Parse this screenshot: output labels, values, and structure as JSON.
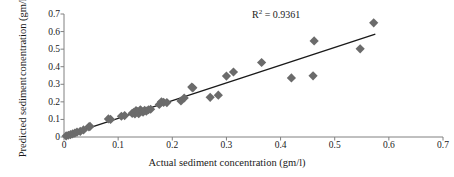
{
  "chart_data": {
    "type": "scatter",
    "title": "",
    "xlabel": "Actual sediment concentration (gm/l)",
    "ylabel_line1": "Predicted sediment",
    "ylabel_line2": "conentration (gm/l)",
    "annotation": "R² = 0.9361",
    "annotation_prefix": "R",
    "annotation_sup": "2",
    "annotation_suffix": " = 0.9361",
    "r_squared": 0.9361,
    "xlim": [
      0,
      0.7
    ],
    "ylim": [
      0,
      0.7
    ],
    "xticks": [
      "0",
      "0.1",
      "0.2",
      "0.3",
      "0.4",
      "0.5",
      "0.6",
      "0.7"
    ],
    "xtick_values": [
      0,
      0.1,
      0.2,
      0.3,
      0.4,
      0.5,
      0.6,
      0.7
    ],
    "yticks": [
      "0",
      "0.1",
      "0.2",
      "0.3",
      "0.4",
      "0.5",
      "0.6",
      "0.7"
    ],
    "ytick_values": [
      0,
      0.1,
      0.2,
      0.3,
      0.4,
      0.5,
      0.6,
      0.7
    ],
    "grid": false,
    "legend": "none",
    "marker": "diamond",
    "marker_color": "#6b6b6b",
    "marker_size": 4.6,
    "line_color": "#1a1a1a",
    "axis_color": "#808080",
    "trendline": {
      "x0": 0.0,
      "y0": 0.005,
      "x1": 0.575,
      "y1": 0.585
    },
    "points": [
      [
        0.004,
        0.006
      ],
      [
        0.008,
        0.01
      ],
      [
        0.012,
        0.014
      ],
      [
        0.016,
        0.018
      ],
      [
        0.02,
        0.022
      ],
      [
        0.024,
        0.028
      ],
      [
        0.03,
        0.032
      ],
      [
        0.036,
        0.04
      ],
      [
        0.046,
        0.058
      ],
      [
        0.048,
        0.06
      ],
      [
        0.082,
        0.103
      ],
      [
        0.086,
        0.1
      ],
      [
        0.106,
        0.118
      ],
      [
        0.112,
        0.122
      ],
      [
        0.126,
        0.135
      ],
      [
        0.129,
        0.14
      ],
      [
        0.131,
        0.131
      ],
      [
        0.133,
        0.15
      ],
      [
        0.136,
        0.145
      ],
      [
        0.138,
        0.133
      ],
      [
        0.141,
        0.155
      ],
      [
        0.143,
        0.148
      ],
      [
        0.146,
        0.142
      ],
      [
        0.149,
        0.152
      ],
      [
        0.152,
        0.147
      ],
      [
        0.156,
        0.155
      ],
      [
        0.16,
        0.158
      ],
      [
        0.176,
        0.185
      ],
      [
        0.18,
        0.2
      ],
      [
        0.184,
        0.197
      ],
      [
        0.19,
        0.196
      ],
      [
        0.216,
        0.205
      ],
      [
        0.222,
        0.222
      ],
      [
        0.236,
        0.284
      ],
      [
        0.238,
        0.28
      ],
      [
        0.27,
        0.226
      ],
      [
        0.285,
        0.238
      ],
      [
        0.3,
        0.347
      ],
      [
        0.313,
        0.37
      ],
      [
        0.365,
        0.424
      ],
      [
        0.42,
        0.336
      ],
      [
        0.46,
        0.348
      ],
      [
        0.462,
        0.547
      ],
      [
        0.547,
        0.502
      ],
      [
        0.572,
        0.65
      ]
    ]
  }
}
